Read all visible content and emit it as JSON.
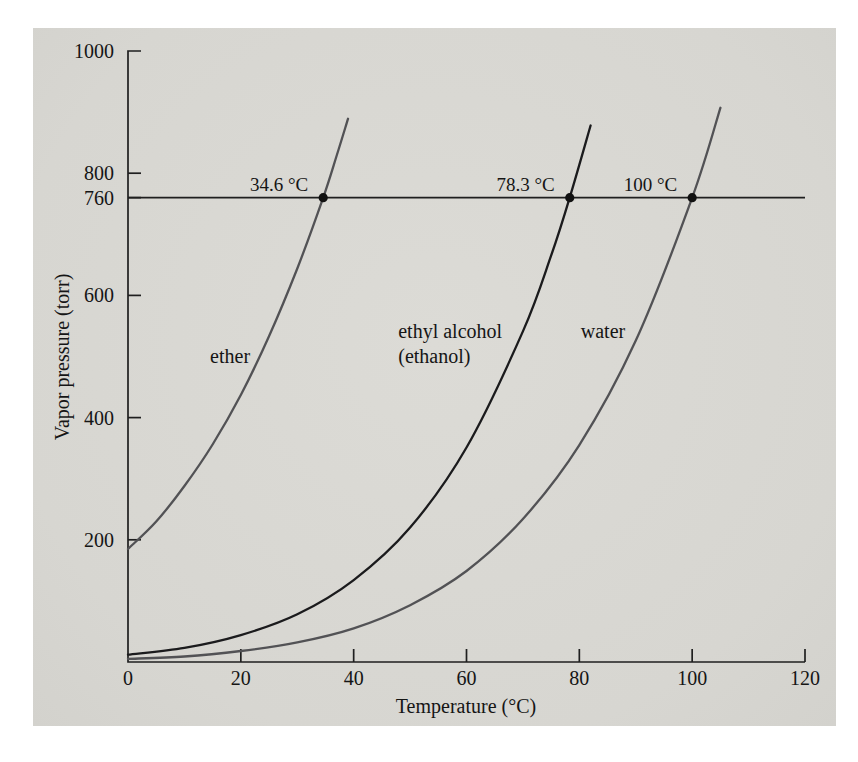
{
  "figure": {
    "background_color": "#ffffff",
    "panel_color": "#d9d8d3",
    "axis_color": "#1f1f1f",
    "text_color": "#151515",
    "point_color": "#111111"
  },
  "chart_data": {
    "type": "line",
    "xlabel": "Temperature (°C)",
    "ylabel": "Vapor pressure (torr)",
    "xlim": [
      0,
      120
    ],
    "ylim": [
      0,
      1000
    ],
    "x_ticks": [
      0,
      20,
      40,
      60,
      80,
      100,
      120
    ],
    "y_ticks": [
      1000,
      800,
      760,
      600,
      400,
      200
    ],
    "grid": false,
    "legend": "inline curve labels",
    "reference_line": {
      "pressure_torr": 760
    },
    "series": [
      {
        "name": "ether",
        "label_lines": [
          "ether"
        ],
        "label_align": "center",
        "label_anchor": {
          "t": 18.1,
          "p": 500
        },
        "color": "#525255",
        "points": [
          [
            0,
            185
          ],
          [
            5,
            230
          ],
          [
            10,
            288
          ],
          [
            15,
            356
          ],
          [
            20,
            437
          ],
          [
            25,
            533
          ],
          [
            30,
            644
          ],
          [
            34.6,
            760
          ],
          [
            37,
            829
          ],
          [
            39,
            889
          ]
        ]
      },
      {
        "name": "ethyl alcohol (ethanol)",
        "label_lines": [
          "ethyl alcohol",
          "(ethanol)"
        ],
        "label_align": "left",
        "label_anchor": {
          "t": 47.9,
          "p": 542
        },
        "color": "#1b1b1d",
        "points": [
          [
            0,
            12
          ],
          [
            10,
            23
          ],
          [
            20,
            44
          ],
          [
            30,
            78
          ],
          [
            40,
            134
          ],
          [
            50,
            220
          ],
          [
            60,
            351
          ],
          [
            70,
            541
          ],
          [
            75,
            665
          ],
          [
            78.3,
            760
          ],
          [
            82,
            878
          ]
        ]
      },
      {
        "name": "water",
        "label_lines": [
          "water"
        ],
        "label_align": "center",
        "label_anchor": {
          "t": 84.2,
          "p": 540
        },
        "color": "#525255",
        "points": [
          [
            0,
            5
          ],
          [
            10,
            9
          ],
          [
            20,
            18
          ],
          [
            30,
            32
          ],
          [
            40,
            55
          ],
          [
            50,
            93
          ],
          [
            60,
            149
          ],
          [
            70,
            234
          ],
          [
            80,
            355
          ],
          [
            90,
            526
          ],
          [
            100,
            760
          ],
          [
            105,
            907
          ]
        ]
      }
    ],
    "boiling_points": [
      {
        "series": "ether",
        "label": "34.6 °C",
        "temperature_c": 34.6,
        "pressure_torr": 760
      },
      {
        "series": "ethyl alcohol (ethanol)",
        "label": "78.3 °C",
        "temperature_c": 78.3,
        "pressure_torr": 760
      },
      {
        "series": "water",
        "label": "100 °C",
        "temperature_c": 100,
        "pressure_torr": 760
      }
    ]
  }
}
